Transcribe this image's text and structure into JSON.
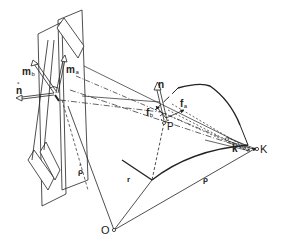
{
  "diagram": {
    "type": "vector-geometry",
    "colors": {
      "stroke": "#222222",
      "background": "#ffffff"
    },
    "labels": {
      "m_b": {
        "base": "m",
        "sub": "b"
      },
      "m_a": {
        "base": "m",
        "sub": "a"
      },
      "n_ring": {
        "base": "n",
        "accent": "°"
      },
      "n": {
        "base": "n"
      },
      "f_b": {
        "base": "f",
        "sub": "b"
      },
      "f_a": {
        "base": "f",
        "sub": "a"
      },
      "P": "P",
      "K": "K",
      "k": "k",
      "O": "O",
      "r": "r",
      "rho": "ρ",
      "rho_ring": {
        "base": "ρ",
        "accent": "°"
      }
    },
    "points": [
      {
        "name": "O",
        "role": "origin"
      },
      {
        "name": "P",
        "role": "surface point"
      },
      {
        "name": "K",
        "role": "projection center"
      }
    ],
    "vectors": [
      {
        "name": "r",
        "from": "O",
        "to": "P"
      },
      {
        "name": "ρ",
        "from": "O",
        "to": "K"
      },
      {
        "name": "ρ°",
        "from": "O",
        "to": "plane"
      },
      {
        "name": "k",
        "at": "K"
      },
      {
        "name": "n",
        "at": "P"
      },
      {
        "name": "f_a",
        "at": "P"
      },
      {
        "name": "f_b",
        "at": "P"
      },
      {
        "name": "m_a",
        "at": "plane"
      },
      {
        "name": "m_b",
        "at": "plane"
      },
      {
        "name": "n°",
        "at": "plane"
      }
    ]
  }
}
